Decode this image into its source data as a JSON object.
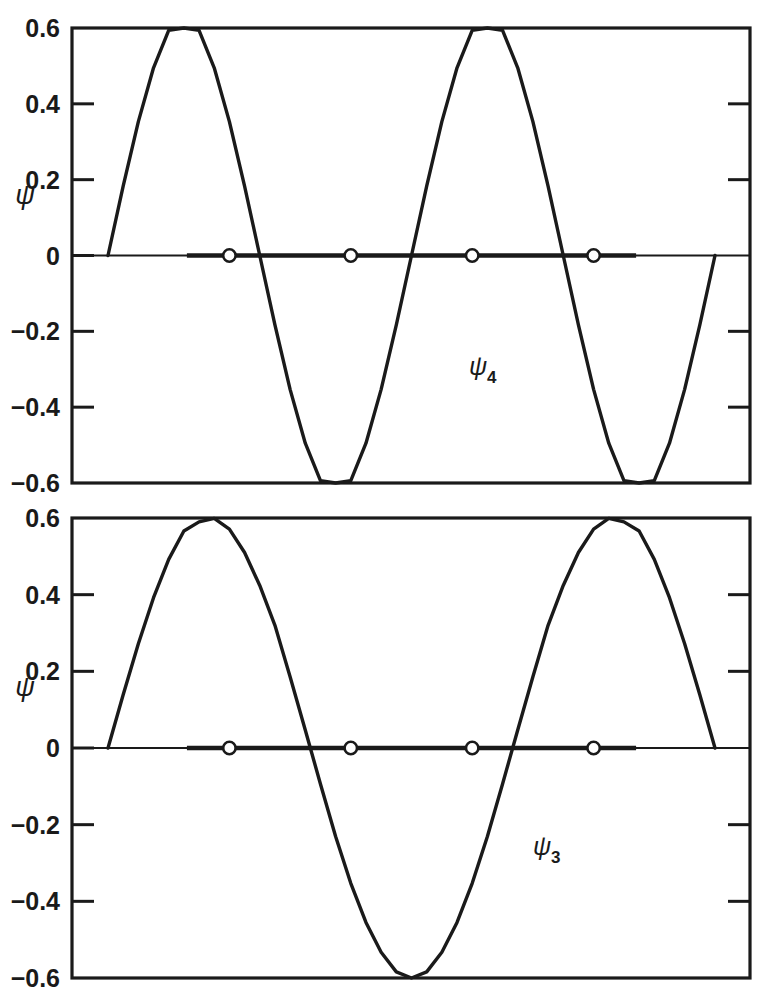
{
  "figure": {
    "name": "particle-in-a-box-wavefunctions",
    "background_color": "#ffffff",
    "line_color": "#1a1a1a",
    "node_marker_fill": "#ffffff"
  },
  "chart_data": [
    {
      "type": "line",
      "panel_id": "psi4",
      "title": "",
      "xlabel": "",
      "ylabel": "ψ",
      "series_label": "ψ",
      "series_subscript": "4",
      "quantum_number": 4,
      "amplitude": 0.6,
      "nodes_interior": 3,
      "half_wavelengths": 4,
      "ylim": [
        -0.6,
        0.6
      ],
      "xlim": [
        0,
        1
      ],
      "grid": false,
      "legend": "none",
      "ytick_labels": [
        "0.6",
        "0.4",
        "0.2",
        "0",
        "−0.2",
        "−0.4",
        "−0.6"
      ],
      "ytick_values": [
        0.6,
        0.4,
        0.2,
        0,
        -0.2,
        -0.4,
        -0.6
      ],
      "ytick_labeled_drawn": [
        0.4,
        0.2,
        -0.2,
        -0.4
      ],
      "xtick_labels": [],
      "zero_line": true,
      "zero_line_markers_x": [
        0.2,
        0.4,
        0.6,
        0.8
      ],
      "zero_line_marker_style": "open-circle",
      "x": [
        0,
        0.025,
        0.05,
        0.075,
        0.1,
        0.125,
        0.15,
        0.175,
        0.2,
        0.225,
        0.25,
        0.275,
        0.3,
        0.325,
        0.35,
        0.375,
        0.4,
        0.425,
        0.45,
        0.475,
        0.5,
        0.525,
        0.55,
        0.575,
        0.6,
        0.625,
        0.65,
        0.675,
        0.7,
        0.725,
        0.75,
        0.775,
        0.8,
        0.825,
        0.85,
        0.875,
        0.9,
        0.925,
        0.95,
        0.975,
        1
      ],
      "values": [
        0,
        0.183,
        0.353,
        0.495,
        0.594,
        0.6,
        0.594,
        0.495,
        0.353,
        0.183,
        0,
        -0.183,
        -0.353,
        -0.495,
        -0.594,
        -0.6,
        -0.594,
        -0.495,
        -0.353,
        -0.183,
        0,
        0.183,
        0.353,
        0.495,
        0.594,
        0.6,
        0.594,
        0.495,
        0.353,
        0.183,
        0,
        -0.183,
        -0.353,
        -0.495,
        -0.594,
        -0.6,
        -0.594,
        -0.495,
        -0.353,
        -0.183,
        0
      ]
    },
    {
      "type": "line",
      "panel_id": "psi3",
      "title": "",
      "xlabel": "",
      "ylabel": "ψ",
      "series_label": "ψ",
      "series_subscript": "3",
      "quantum_number": 3,
      "amplitude": 0.6,
      "nodes_interior": 2,
      "half_wavelengths": 3,
      "ylim": [
        -0.6,
        0.6
      ],
      "xlim": [
        0,
        1
      ],
      "grid": false,
      "legend": "none",
      "ytick_labels": [
        "0.6",
        "0.4",
        "0.2",
        "0",
        "−0.2",
        "−0.4",
        "−0.6"
      ],
      "ytick_values": [
        0.6,
        0.4,
        0.2,
        0,
        -0.2,
        -0.4,
        -0.6
      ],
      "ytick_labeled_drawn": [
        0.4,
        0.2,
        -0.2,
        -0.4
      ],
      "xtick_labels": [],
      "zero_line": true,
      "zero_line_markers_x": [
        0.2,
        0.4,
        0.6,
        0.8
      ],
      "zero_line_marker_style": "open-circle",
      "x": [
        0,
        0.025,
        0.05,
        0.075,
        0.1,
        0.125,
        0.15,
        0.175,
        0.2,
        0.225,
        0.25,
        0.275,
        0.3,
        0.325,
        0.35,
        0.375,
        0.4,
        0.425,
        0.45,
        0.475,
        0.5,
        0.525,
        0.55,
        0.575,
        0.6,
        0.625,
        0.65,
        0.675,
        0.7,
        0.725,
        0.75,
        0.775,
        0.8,
        0.825,
        0.85,
        0.875,
        0.9,
        0.925,
        0.95,
        0.975,
        1
      ],
      "values": [
        0,
        0.139,
        0.272,
        0.392,
        0.492,
        0.566,
        0.59,
        0.599,
        0.571,
        0.51,
        0.424,
        0.32,
        0.186,
        0.047,
        -0.094,
        -0.231,
        -0.353,
        -0.455,
        -0.533,
        -0.584,
        -0.6,
        -0.584,
        -0.533,
        -0.455,
        -0.353,
        -0.231,
        -0.094,
        0.047,
        0.186,
        0.32,
        0.424,
        0.51,
        0.571,
        0.599,
        0.59,
        0.566,
        0.492,
        0.392,
        0.272,
        0.139,
        0
      ]
    }
  ],
  "panels": [
    {
      "id": "psi4",
      "axis_title": "ψ",
      "curve_label_main": "ψ",
      "curve_label_sub": "4",
      "ticks": [
        {
          "value": 0.6,
          "label": "0.6",
          "has_mark": false
        },
        {
          "value": 0.4,
          "label": "0.4",
          "has_mark": true
        },
        {
          "value": 0.2,
          "label": "0.2",
          "has_mark": true
        },
        {
          "value": 0.0,
          "label": "0",
          "has_mark": true
        },
        {
          "value": -0.2,
          "label": "−0.2",
          "has_mark": true
        },
        {
          "value": -0.4,
          "label": "−0.4",
          "has_mark": true
        },
        {
          "value": -0.6,
          "label": "−0.6",
          "has_mark": false
        }
      ],
      "right_ticks": [
        0.4,
        0.2,
        -0.2,
        -0.4
      ]
    },
    {
      "id": "psi3",
      "axis_title": "ψ",
      "curve_label_main": "ψ",
      "curve_label_sub": "3",
      "ticks": [
        {
          "value": 0.6,
          "label": "0.6",
          "has_mark": false
        },
        {
          "value": 0.4,
          "label": "0.4",
          "has_mark": true
        },
        {
          "value": 0.2,
          "label": "0.2",
          "has_mark": true
        },
        {
          "value": 0.0,
          "label": "0",
          "has_mark": true
        },
        {
          "value": -0.2,
          "label": "−0.2",
          "has_mark": true
        },
        {
          "value": -0.4,
          "label": "−0.4",
          "has_mark": true
        },
        {
          "value": -0.6,
          "label": "−0.6",
          "has_mark": false
        }
      ],
      "right_ticks": [
        0.4,
        0.2,
        -0.2,
        -0.4
      ]
    }
  ]
}
